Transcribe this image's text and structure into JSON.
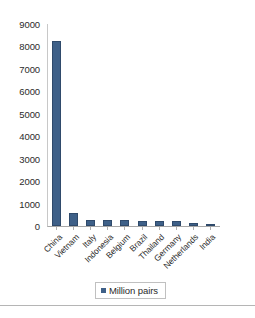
{
  "chart_data": {
    "type": "bar",
    "title": "",
    "subtitle": "",
    "xlabel": "",
    "ylabel": "",
    "categories": [
      "China",
      "Vietnam",
      "Italy",
      "Indonesia",
      "Belgium",
      "Brazil",
      "Thailand",
      "Germany",
      "Netherlands",
      "India"
    ],
    "values": [
      8240,
      580,
      290,
      250,
      250,
      240,
      230,
      210,
      130,
      90
    ],
    "series": [
      {
        "name": "Million pairs",
        "values": [
          8240,
          580,
          290,
          250,
          250,
          240,
          230,
          210,
          130,
          90
        ]
      }
    ],
    "ylim": [
      0,
      9000
    ],
    "ytick_labels": [
      "9000",
      "8000",
      "7000",
      "6000",
      "5000",
      "4000",
      "3000",
      "2000",
      "1000",
      "0"
    ],
    "ytick_values": [
      9000,
      8000,
      7000,
      6000,
      5000,
      4000,
      3000,
      2000,
      1000,
      0
    ],
    "grid": false,
    "legend": {
      "position": "bottom",
      "entries": [
        {
          "label": "Million pairs",
          "color": "#3e6088",
          "marker": "legend-swatch-square"
        }
      ]
    },
    "colors": {
      "bar": "#3e6088",
      "bar_border": "#2f4a6b",
      "axis": "#b0b0b0",
      "text": "#2b2b2b",
      "background": "#ffffff",
      "rule": "#b5b5b5"
    }
  }
}
